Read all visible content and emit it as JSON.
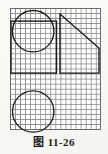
{
  "figure": {
    "caption_label": "图",
    "caption_number": "11-26",
    "caption_full": "图 11-26",
    "background_color": "#fdfdfb",
    "grid": {
      "line_color": "#8e8e8e",
      "border_color": "#6a6a6a",
      "cell_size_px": 5.05,
      "columns": 18,
      "rows": 24
    },
    "stroke_color": "#1a1a1a",
    "shapes": [
      {
        "name": "upper-circle",
        "type": "circle",
        "cx_cells": 4.6,
        "cy_cells": 4.6,
        "r_cells": 4.1
      },
      {
        "name": "square-outline",
        "type": "rect",
        "x_cells": 0.2,
        "y_cells": 2.6,
        "w_cells": 9.0,
        "h_cells": 10.3
      },
      {
        "name": "right-triangle",
        "type": "polyline",
        "points_cells": "9.9,1.2 17.6,7.9 17.6,12.9 9.9,12.9 9.9,1.2"
      },
      {
        "name": "lower-circle",
        "type": "circle",
        "cx_cells": 4.6,
        "cy_cells": 20.5,
        "r_cells": 4.1
      }
    ]
  }
}
